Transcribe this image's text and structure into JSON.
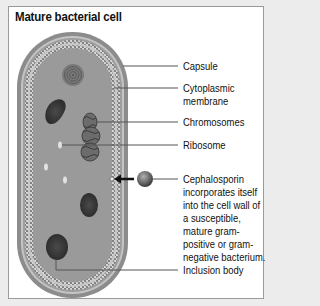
{
  "title": "Mature bacterial cell",
  "labels": {
    "capsule": "Capsule",
    "cytoplasmic_membrane_line1": "Cytoplasmic",
    "cytoplasmic_membrane_line2": "membrane",
    "chromosomes": "Chromosomes",
    "ribosome": "Ribosome",
    "cephalosporin_line1": "Cephalosporin",
    "cephalosporin_line2": "incorporates itself",
    "cephalosporin_line3": "into the cell wall of",
    "cephalosporin_line4": "a susceptible,",
    "cephalosporin_line5": "mature gram-",
    "cephalosporin_line6": "positive or gram-",
    "cephalosporin_line7": "negative bacterium.",
    "inclusion_body": "Inclusion body"
  },
  "colors": {
    "background": "#ececec",
    "panel": "#ffffff",
    "capsule": "#8c8c8c",
    "cytoplasm": "#9a9a9a",
    "dark_body": "#3e3e3e",
    "leader_line": "#555555"
  }
}
